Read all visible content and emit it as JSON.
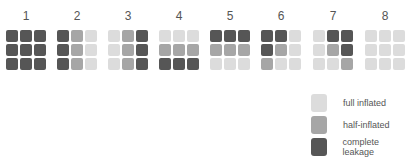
{
  "colors": {
    "L": "#dcdcdc",
    "M": "#a6a6a6",
    "D": "#565656"
  },
  "grids": [
    {
      "label": "1",
      "cells": [
        "D",
        "D",
        "D",
        "D",
        "D",
        "D",
        "D",
        "D",
        "D"
      ]
    },
    {
      "label": "2",
      "cells": [
        "D",
        "M",
        "L",
        "D",
        "M",
        "L",
        "D",
        "M",
        "L"
      ]
    },
    {
      "label": "3",
      "cells": [
        "L",
        "M",
        "D",
        "L",
        "M",
        "D",
        "L",
        "M",
        "D"
      ]
    },
    {
      "label": "4",
      "cells": [
        "L",
        "L",
        "L",
        "M",
        "M",
        "M",
        "D",
        "D",
        "D"
      ]
    },
    {
      "label": "5",
      "cells": [
        "D",
        "D",
        "D",
        "M",
        "M",
        "M",
        "L",
        "L",
        "L"
      ]
    },
    {
      "label": "6",
      "cells": [
        "D",
        "D",
        "L",
        "D",
        "M",
        "L",
        "M",
        "L",
        "L"
      ]
    },
    {
      "label": "7",
      "cells": [
        "L",
        "D",
        "D",
        "L",
        "M",
        "D",
        "L",
        "L",
        "M"
      ]
    },
    {
      "label": "8",
      "cells": [
        "L",
        "L",
        "L",
        "L",
        "L",
        "L",
        "L",
        "L",
        "L"
      ]
    }
  ],
  "legend": [
    {
      "key": "L",
      "label": "full inflated"
    },
    {
      "key": "M",
      "label": "half-inflated"
    },
    {
      "key": "D",
      "label": "complete leakage"
    }
  ]
}
